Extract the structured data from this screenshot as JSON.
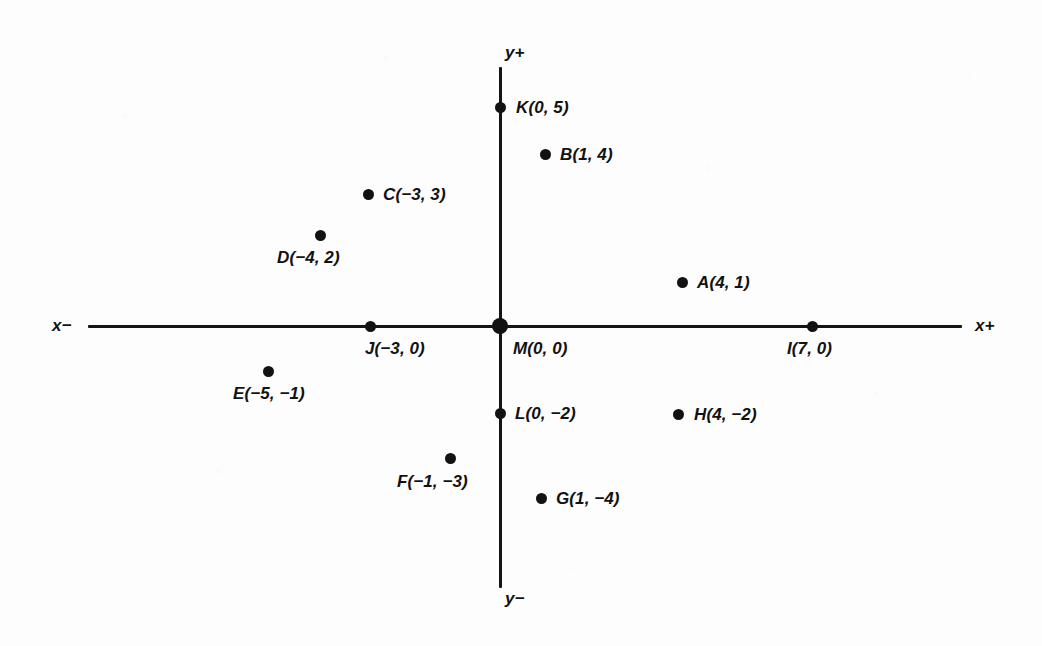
{
  "figure": {
    "kind": "coordinate-plane-scatter",
    "background_color": "#fdfdfd",
    "ink_color": "#121212"
  },
  "axes": {
    "x_negative_label": "x−",
    "x_positive_label": "x+",
    "y_positive_label": "y+",
    "y_negative_label": "y−",
    "origin_x_px": 500,
    "origin_y_px": 326,
    "x_axis_start_px": 88,
    "x_axis_end_px": 962,
    "y_axis_top_px": 67,
    "y_axis_bottom_px": 588
  },
  "chart_data": {
    "type": "scatter",
    "title": "",
    "xlabel": "x",
    "ylabel": "y",
    "grid": false,
    "legend": "none",
    "xlim": [
      -7,
      8
    ],
    "ylim": [
      -6,
      6
    ],
    "unit_px_x": 48,
    "unit_px_y": 44,
    "points": [
      {
        "name": "A",
        "label": "A(4, 1)",
        "x": 4,
        "y": 1,
        "dot_px": [
          682,
          282
        ],
        "label_px": [
          697,
          274
        ],
        "dot_size": 11
      },
      {
        "name": "B",
        "label": "B(1, 4)",
        "x": 1,
        "y": 4,
        "dot_px": [
          545,
          154
        ],
        "label_px": [
          560,
          146
        ],
        "dot_size": 11
      },
      {
        "name": "C",
        "label": "C(−3, 3)",
        "x": -3,
        "y": 3,
        "dot_px": [
          368,
          194
        ],
        "label_px": [
          383,
          186
        ],
        "dot_size": 11
      },
      {
        "name": "D",
        "label": "D(−4, 2)",
        "x": -4,
        "y": 2,
        "dot_px": [
          320,
          235
        ],
        "label_px": [
          277,
          249
        ],
        "dot_size": 11
      },
      {
        "name": "E",
        "label": "E(−5, −1)",
        "x": -5,
        "y": -1,
        "dot_px": [
          268,
          371
        ],
        "label_px": [
          233,
          385
        ],
        "dot_size": 11
      },
      {
        "name": "F",
        "label": "F(−1, −3)",
        "x": -1,
        "y": -3,
        "dot_px": [
          450,
          458
        ],
        "label_px": [
          397,
          473
        ],
        "dot_size": 11
      },
      {
        "name": "G",
        "label": "G(1, −4)",
        "x": 1,
        "y": -4,
        "dot_px": [
          541,
          498
        ],
        "label_px": [
          556,
          490
        ],
        "dot_size": 11
      },
      {
        "name": "H",
        "label": "H(4, −2)",
        "x": 4,
        "y": -2,
        "dot_px": [
          678,
          414
        ],
        "label_px": [
          694,
          406
        ],
        "dot_size": 11
      },
      {
        "name": "I",
        "label": "I(7, 0)",
        "x": 7,
        "y": 0,
        "dot_px": [
          812,
          326
        ],
        "label_px": [
          787,
          340
        ],
        "dot_size": 11
      },
      {
        "name": "J",
        "label": "J(−3, 0)",
        "x": -3,
        "y": 0,
        "dot_px": [
          370,
          326
        ],
        "label_px": [
          365,
          340
        ],
        "dot_size": 11
      },
      {
        "name": "K",
        "label": "K(0, 5)",
        "x": 0,
        "y": 5,
        "dot_px": [
          500,
          107
        ],
        "label_px": [
          516,
          99
        ],
        "dot_size": 11
      },
      {
        "name": "L",
        "label": "L(0, −2)",
        "x": 0,
        "y": -2,
        "dot_px": [
          500,
          413
        ],
        "label_px": [
          515,
          405
        ],
        "dot_size": 11
      },
      {
        "name": "M",
        "label": "M(0, 0)",
        "x": 0,
        "y": 0,
        "dot_px": [
          500,
          326
        ],
        "label_px": [
          513,
          340
        ],
        "dot_size": 16
      }
    ]
  },
  "axis_labels": {
    "x_negative": {
      "text": "x−",
      "px": [
        52,
        317
      ]
    },
    "x_positive": {
      "text": "x+",
      "px": [
        975,
        317
      ]
    },
    "y_positive": {
      "text": "y+",
      "px": [
        505,
        44
      ]
    },
    "y_negative": {
      "text": "y−",
      "px": [
        505,
        590
      ]
    }
  }
}
